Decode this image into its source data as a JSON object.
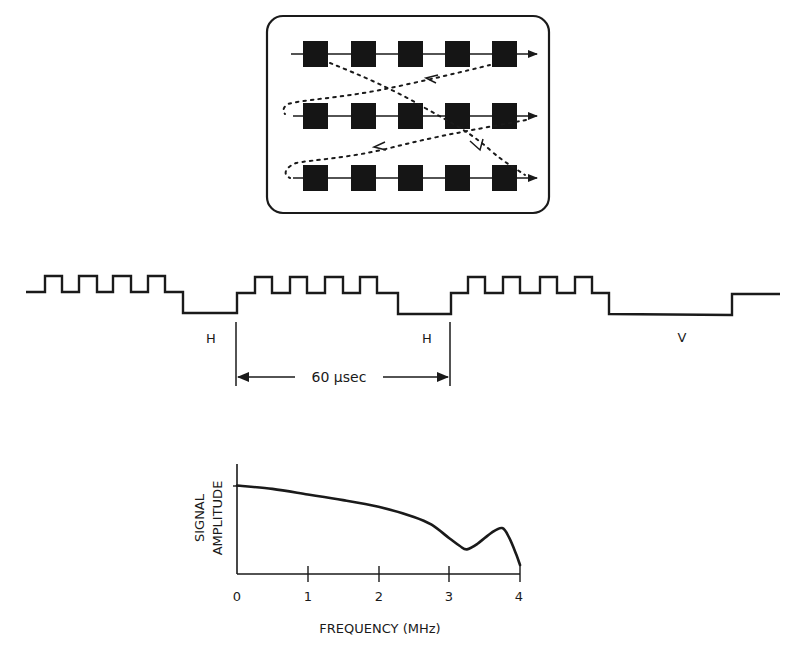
{
  "figure": {
    "scan_panel": {
      "rows": 3,
      "pixels_per_row": 5,
      "description": "raster scan pattern with scan lines and dotted retrace paths"
    },
    "waveform": {
      "labels": {
        "h_sync_1": "H",
        "h_sync_2": "H",
        "v_sync": "V",
        "duration": "60 µsec"
      }
    },
    "spectrum_chart": {
      "ylabel_line1": "SIGNAL",
      "ylabel_line2": "AMPLITUDE",
      "xlabel": "FREQUENCY (MHz)",
      "xticks": [
        "0",
        "1",
        "2",
        "3",
        "4"
      ]
    }
  },
  "chart_data": {
    "type": "line",
    "title": "",
    "xlabel": "FREQUENCY (MHz)",
    "ylabel": "SIGNAL AMPLITUDE",
    "xlim": [
      0,
      4
    ],
    "ylim": [
      0,
      1
    ],
    "x_tick_labels": [
      "0",
      "1",
      "2",
      "3",
      "4"
    ],
    "grid": false,
    "legend": null,
    "series": [
      {
        "name": "signal amplitude",
        "x": [
          0,
          0.5,
          1.0,
          1.5,
          2.0,
          2.5,
          2.75,
          3.0,
          3.15,
          3.25,
          3.4,
          3.6,
          3.75,
          3.85,
          3.95,
          4.0
        ],
        "values": [
          0.79,
          0.76,
          0.71,
          0.66,
          0.6,
          0.51,
          0.44,
          0.32,
          0.25,
          0.22,
          0.27,
          0.37,
          0.41,
          0.32,
          0.17,
          0.08
        ]
      }
    ]
  }
}
